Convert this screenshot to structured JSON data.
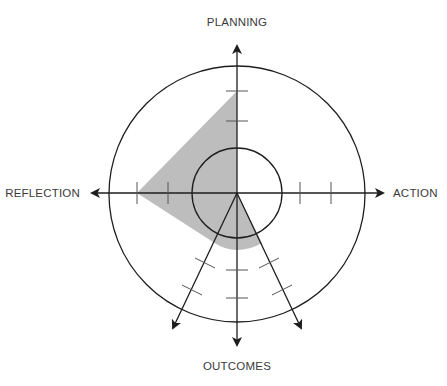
{
  "diagram": {
    "type": "radar-reflection-model",
    "labels": {
      "top": "PLANNING",
      "right": "ACTION",
      "bottom": "OUTCOMES",
      "left": "REFLECTION"
    },
    "colors": {
      "stroke": "#1e1e1e",
      "tick": "#555555",
      "fill": "#bdbdbd",
      "label": "#3a3a3a",
      "background": "#ffffff"
    },
    "center": [
      237,
      193
    ],
    "inner_circle_radius": 45,
    "outer_circle_radius": 128,
    "axes": [
      {
        "name": "planning",
        "direction": "up"
      },
      {
        "name": "action",
        "direction": "right"
      },
      {
        "name": "outcomes",
        "direction": "down"
      },
      {
        "name": "outcomes-left",
        "direction": "down-left"
      },
      {
        "name": "outcomes-right",
        "direction": "down-right"
      },
      {
        "name": "reflection",
        "direction": "left"
      }
    ],
    "shaded_region": {
      "planning": 102,
      "reflection": 100,
      "outcomes": 57
    }
  }
}
